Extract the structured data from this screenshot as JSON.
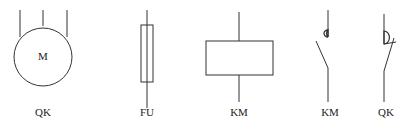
{
  "symbols": [
    {
      "id": "motor",
      "inner_text": "M",
      "label": "QK"
    },
    {
      "id": "fuse",
      "label": "FU"
    },
    {
      "id": "coil",
      "label": "KM"
    },
    {
      "id": "km-contact",
      "label": "KM"
    },
    {
      "id": "qk-contact",
      "label": "QK"
    }
  ]
}
